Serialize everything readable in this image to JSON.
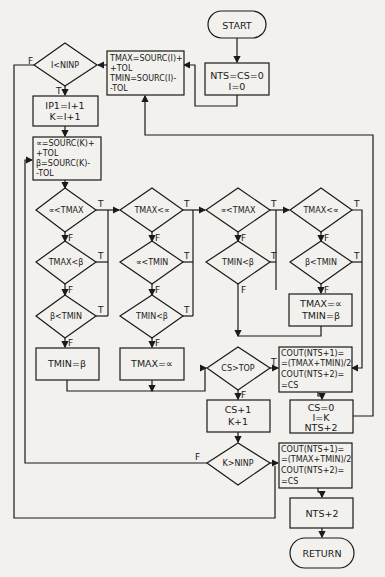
{
  "diagram": {
    "type": "flowchart",
    "colors": {
      "stroke": "#1a1a1a",
      "background": "#f2f1ee",
      "fill": "#f2f1ee"
    },
    "nodes": {
      "start": {
        "shape": "terminator",
        "label": "START"
      },
      "init": {
        "shape": "process",
        "lines": [
          "NTS=CS=0",
          "I=0"
        ]
      },
      "tmax_tmin_set": {
        "shape": "process",
        "lines": [
          "TMAX=SOURC(I)+",
          "+TOL",
          "TMIN=SOURC(I)-",
          "-TOL"
        ]
      },
      "i_lt_ninp": {
        "shape": "decision",
        "label": "I<NINP"
      },
      "ip1_k": {
        "shape": "process",
        "lines": [
          "IP1=I+1",
          "K=I+1"
        ]
      },
      "alpha_beta": {
        "shape": "process",
        "lines": [
          "∝=SOURC(K)+",
          "+TOL",
          "β=SOURC(K)-",
          "-TOL"
        ]
      },
      "d1": {
        "shape": "decision",
        "label": "∝<TMAX"
      },
      "d2": {
        "shape": "decision",
        "label": "TMAX<∝"
      },
      "d3": {
        "shape": "decision",
        "label": "∝<TMAX"
      },
      "d4": {
        "shape": "decision",
        "label": "TMAX<∝"
      },
      "d5": {
        "shape": "decision",
        "label": "TMAX<β"
      },
      "d6": {
        "shape": "decision",
        "label": "∝<TMIN"
      },
      "d7": {
        "shape": "decision",
        "label": "TMIN<β"
      },
      "d8": {
        "shape": "decision",
        "label": "β<TMIN"
      },
      "d9": {
        "shape": "decision",
        "label": "β<TMIN"
      },
      "d10": {
        "shape": "decision",
        "label": "TMIN<β"
      },
      "set_both": {
        "shape": "process",
        "lines": [
          "TMAX=∝",
          "TMIN=β"
        ]
      },
      "set_tmin": {
        "shape": "process",
        "label": "TMIN=β"
      },
      "set_tmax": {
        "shape": "process",
        "label": "TMAX=∝"
      },
      "cs_gt_top": {
        "shape": "decision",
        "label": "CS>TOP"
      },
      "cout1": {
        "shape": "process",
        "lines": [
          "COUT(NTS+1)=",
          "=(TMAX+TMIN)/2",
          "COUT(NTS+2)=",
          "=CS"
        ]
      },
      "reset": {
        "shape": "process",
        "lines": [
          "CS=0",
          "I=K",
          "NTS+2"
        ]
      },
      "cs_k_inc": {
        "shape": "process",
        "lines": [
          "CS+1",
          "K+1"
        ]
      },
      "k_gt_ninp": {
        "shape": "decision",
        "label": "K>NINP"
      },
      "cout2": {
        "shape": "process",
        "lines": [
          "COUT(NTS+1)=",
          "=(TMAX+TMIN)/2",
          "COUT(NTS+2)=",
          "=CS"
        ]
      },
      "nts_inc": {
        "shape": "process",
        "label": "NTS+2"
      },
      "return": {
        "shape": "terminator",
        "label": "RETURN"
      }
    },
    "branch_labels": {
      "true": "T",
      "false": "F"
    }
  }
}
